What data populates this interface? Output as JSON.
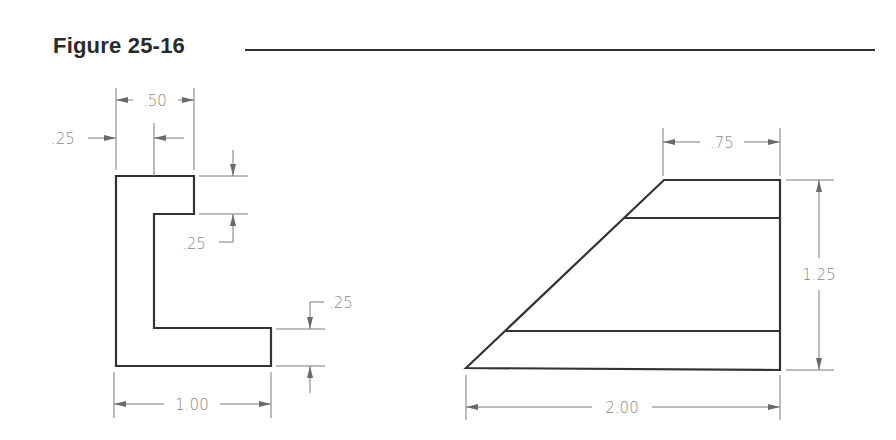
{
  "figure": {
    "title": "Figure 25-16"
  },
  "left_view": {
    "name": "L-shaped profile",
    "dimensions": {
      "top_width": ".50",
      "inner_offset": ".25",
      "upper_flange_thickness": ".25",
      "lower_flange_thickness": ".25",
      "overall_width": "1.00"
    }
  },
  "right_view": {
    "name": "Trapezoidal profile with two horizontal lines",
    "dimensions": {
      "top_width": ".75",
      "height": "1.25",
      "bottom_width": "2.00"
    }
  },
  "colors": {
    "object_line": "#333333",
    "dimension_line": "#7a7a7a",
    "dimension_text": "#8a8a8a",
    "title": "#2a2a2a"
  }
}
